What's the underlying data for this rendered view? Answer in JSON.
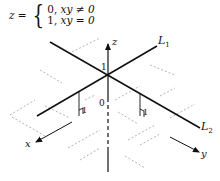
{
  "equation": {
    "lhs": "z =",
    "case1_value": "0,",
    "case1_condition": "xy ≠ 0",
    "case2_value": "1,",
    "case2_condition": "xy = 0"
  },
  "labels": {
    "z_axis": "z",
    "x_axis": "x",
    "y_axis": "y",
    "line1": "L",
    "line1_sub": "1",
    "line2": "L",
    "line2_sub": "2",
    "height_one": "1",
    "origin": "0",
    "marker_left": "1",
    "marker_right": "1"
  },
  "colors": {
    "ink": "#111111",
    "dashed": "#9a9a9a"
  }
}
